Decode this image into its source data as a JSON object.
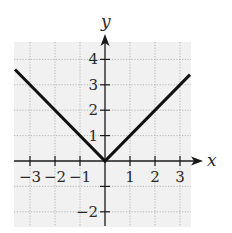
{
  "chart_data": {
    "type": "line",
    "title": "",
    "function": "y = |x|",
    "xlabel": "x",
    "ylabel": "y",
    "xlim": [
      -3.6,
      3.6
    ],
    "ylim": [
      -2.6,
      4.7
    ],
    "grid": true,
    "grid_style": "dotted",
    "legend": null,
    "x_ticks": [
      -3,
      -2,
      -1,
      1,
      2,
      3
    ],
    "x_tick_labels": [
      "−3",
      "−2",
      "−1",
      "1",
      "2",
      "3"
    ],
    "y_ticks": [
      -2,
      -1,
      1,
      2,
      3,
      4
    ],
    "y_tick_labels": [
      "−2",
      "",
      "1",
      "2",
      "3",
      "4"
    ],
    "series": [
      {
        "name": "y = |x|",
        "color": "#111111",
        "x": [
          -3.6,
          0,
          3.4
        ],
        "y": [
          3.6,
          0,
          3.4
        ]
      }
    ]
  },
  "colors": {
    "background": "#ffffff",
    "grid_fill": "#f1f1f1",
    "grid_line": "#9a9a9a",
    "axis": "#1a1a1a",
    "curve": "#111111"
  }
}
